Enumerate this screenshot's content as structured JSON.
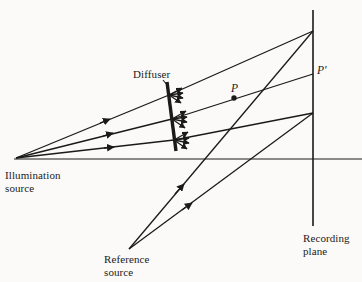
{
  "figure": {
    "kind": "optical-ray-diagram",
    "topic": "diffuse-object hologram recording geometry",
    "background_color": "#fbfaf8",
    "ink_color": "#1a1a1a"
  },
  "labels": {
    "illumination_source": "Illumination\nsource",
    "diffuser": "Diffuser",
    "point_p": "P",
    "point_p_prime": "P′",
    "reference_source": "Reference\nsource",
    "recording_plane": "Recording\nplane"
  },
  "diagram_data": {
    "type": "ray-diagram",
    "axis": {
      "name": "optical-axis",
      "orientation": "horizontal",
      "x1": 14,
      "y1": 159,
      "x2": 362,
      "y2": 159
    },
    "recording_plane": {
      "name": "recording-plane",
      "orientation": "vertical",
      "x": 313,
      "y_top": 10,
      "y_bottom": 226
    },
    "diffuser": {
      "name": "diffuser-plate",
      "x1": 167,
      "y1": 82,
      "x2": 176,
      "y2": 151,
      "thickness": 3.2,
      "scatter_points": [
        {
          "x": 169,
          "y": 95
        },
        {
          "x": 172,
          "y": 119
        },
        {
          "x": 174,
          "y": 140
        }
      ]
    },
    "sources": [
      {
        "name": "illumination-source",
        "x": 16,
        "y": 158
      },
      {
        "name": "reference-source",
        "x": 129,
        "y": 249
      }
    ],
    "object_point": {
      "name": "P",
      "x": 234,
      "y": 98
    },
    "image_point": {
      "name": "P-prime",
      "x": 313,
      "y": 74
    },
    "illumination_rays": [
      {
        "from": [
          16,
          158
        ],
        "to": [
          169,
          95
        ],
        "arrow_at": 0.58
      },
      {
        "from": [
          16,
          158
        ],
        "to": [
          172,
          119
        ],
        "arrow_at": 0.58
      },
      {
        "from": [
          16,
          158
        ],
        "to": [
          174,
          140
        ],
        "arrow_at": 0.58
      }
    ],
    "object_rays": [
      {
        "from": [
          169,
          95
        ],
        "to": [
          313,
          31
        ],
        "arrow_at": null
      },
      {
        "from": [
          172,
          119
        ],
        "to": [
          313,
          74
        ],
        "arrow_at": null
      },
      {
        "from": [
          174,
          140
        ],
        "to": [
          313,
          113
        ],
        "arrow_at": null
      }
    ],
    "reference_rays": [
      {
        "from": [
          129,
          249
        ],
        "to": [
          313,
          31
        ],
        "arrow_at": 0.36
      },
      {
        "from": [
          129,
          249
        ],
        "to": [
          313,
          113
        ],
        "arrow_at": 0.32
      }
    ],
    "scatter_fan": {
      "arrow_length": 14,
      "angles_deg": [
        -28,
        -10,
        6,
        20
      ]
    }
  }
}
